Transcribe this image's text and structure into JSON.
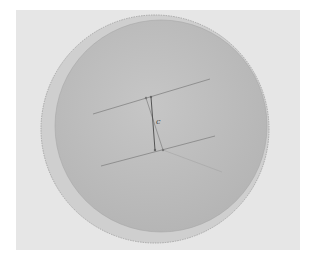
{
  "figure": {
    "colors": {
      "background_panel": "#e6e6e6",
      "outer_sphere_fill": "#cfcfcf",
      "outer_sphere_stroke": "#9a9a9a",
      "inner_sphere_fill": "#bdbdbd",
      "line_color": "#8a8a8a",
      "segment_color": "#555555"
    },
    "labels": {
      "segment": "c"
    },
    "outer_sphere": {
      "cx": 155,
      "cy": 129,
      "r": 114
    },
    "inner_sphere": {
      "cx": 161,
      "cy": 126,
      "r": 106
    },
    "lines": [
      {
        "name": "upper-line",
        "x1": 93,
        "y1": 114,
        "x2": 210,
        "y2": 79
      },
      {
        "name": "lower-line",
        "x1": 101,
        "y1": 166,
        "x2": 215,
        "y2": 136
      },
      {
        "name": "segment-c",
        "x1": 151,
        "y1": 97,
        "x2": 155,
        "y2": 150
      },
      {
        "name": "segment-c-shadow",
        "x1": 146,
        "y1": 98,
        "x2": 163,
        "y2": 150
      },
      {
        "name": "faint-diagonal",
        "x1": 163,
        "y1": 150,
        "x2": 222,
        "y2": 172
      }
    ],
    "points": [
      {
        "x": 146,
        "y": 98
      },
      {
        "x": 151,
        "y": 97
      },
      {
        "x": 155,
        "y": 150
      },
      {
        "x": 163,
        "y": 150
      }
    ]
  }
}
